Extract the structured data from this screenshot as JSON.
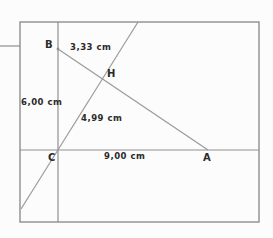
{
  "figure": {
    "points": {
      "b": "B",
      "h": "H",
      "c": "C",
      "a": "A"
    },
    "measurements": {
      "bh": "3,33 cm",
      "bc": "6,00 cm",
      "ch": "4,99 cm",
      "ca": "9,00 cm"
    },
    "colors": {
      "line": "#8f8f8f",
      "text": "#2a2a2a",
      "paper": "#fcfcfc"
    }
  }
}
